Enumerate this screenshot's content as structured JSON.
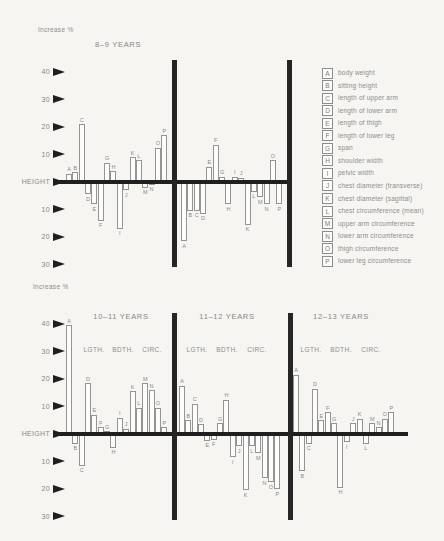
{
  "labels": {
    "increase_top": "Increase %",
    "increase_bottom": "Increase %",
    "height_axis": "HEIGHT"
  },
  "colors": {
    "background": "#f6f5f2",
    "line": "#1f1f1f",
    "divider": "#252525",
    "bar_fill": "#fcfcfa",
    "bar_border": "#949494",
    "text_gray": "#8c8c8c"
  },
  "legend": {
    "position": "right",
    "items": [
      {
        "key": "A",
        "label": "body weight"
      },
      {
        "key": "B",
        "label": "sitting height"
      },
      {
        "key": "C",
        "label": "length of upper arm"
      },
      {
        "key": "D",
        "label": "length of lower arm"
      },
      {
        "key": "E",
        "label": "length of thigh"
      },
      {
        "key": "F",
        "label": "length of lower leg"
      },
      {
        "key": "G",
        "label": "span"
      },
      {
        "key": "H",
        "label": "shoulder width"
      },
      {
        "key": "I",
        "label": "pelvic width"
      },
      {
        "key": "J",
        "label": "chest diameter (transverse)"
      },
      {
        "key": "K",
        "label": "chest diameter (sagittal)"
      },
      {
        "key": "L",
        "label": "chest circumference (mean)"
      },
      {
        "key": "M",
        "label": "upper arm circumference"
      },
      {
        "key": "N",
        "label": "lower arm circumference"
      },
      {
        "key": "O",
        "label": "thigh circumference"
      },
      {
        "key": "P",
        "label": "lower leg circumference"
      }
    ]
  },
  "chart_data": [
    {
      "type": "bar",
      "ylabel": "Increase %",
      "baseline_label": "HEIGHT",
      "ylim": [
        -32,
        45
      ],
      "grid": false,
      "legend_position": "right",
      "yticks": [
        40,
        30,
        20,
        10,
        0,
        -10,
        -20,
        -30
      ],
      "ytick_display": [
        "40",
        "30",
        "20",
        "10",
        "HEIGHT",
        "10",
        "20",
        "30"
      ],
      "categories": [
        "A",
        "B",
        "C",
        "D",
        "E",
        "F",
        "G",
        "H",
        "I",
        "J",
        "K",
        "L",
        "M",
        "N",
        "O",
        "P"
      ],
      "panels": [
        {
          "title": "8–9 YEARS",
          "values": [
            3,
            3.5,
            21,
            -4.5,
            -8,
            -14,
            7,
            4,
            -17,
            -3,
            9,
            8,
            -2,
            -1,
            12.5,
            17
          ]
        },
        {
          "title": "",
          "values": [
            -21.5,
            -10.5,
            -10.5,
            -11.5,
            5.5,
            13.5,
            2,
            -8,
            2,
            1.5,
            -15.5,
            -3.5,
            -5.5,
            -8,
            8,
            -8
          ]
        }
      ]
    },
    {
      "type": "bar",
      "ylabel": "Increase %",
      "baseline_label": "HEIGHT",
      "ylim": [
        -32,
        45
      ],
      "grid": false,
      "group_labels": [
        "LGTH.",
        "BDTH.",
        "CIRC."
      ],
      "yticks": [
        40,
        30,
        20,
        10,
        0,
        -10,
        -20,
        -30
      ],
      "ytick_display": [
        "40",
        "30",
        "20",
        "10",
        "HEIGHT",
        "10",
        "20",
        "30"
      ],
      "categories": [
        "A",
        "B",
        "C",
        "D",
        "E",
        "F",
        "G",
        "H",
        "I",
        "J",
        "K",
        "L",
        "M",
        "N",
        "O",
        "P"
      ],
      "panels": [
        {
          "title": "10–11 YEARS",
          "values": [
            39.5,
            -3.5,
            -11.5,
            18.5,
            7,
            2.5,
            1,
            -5,
            6,
            2,
            15.5,
            9.5,
            18.5,
            16,
            9.5,
            2.5
          ]
        },
        {
          "title": "11–12 YEARS",
          "values": [
            17.5,
            5,
            11,
            3.5,
            -2.5,
            -2,
            4,
            12.5,
            -8.5,
            -4.5,
            -20.5,
            -4.5,
            -7,
            -16,
            -17.5,
            -20
          ]
        },
        {
          "title": "12–13 YEARS",
          "values": [
            21.5,
            -13.5,
            -3.5,
            16.5,
            5,
            8,
            4,
            -19.5,
            -3,
            4,
            5.5,
            -3.5,
            4,
            2.5,
            5.5,
            8
          ]
        }
      ]
    }
  ]
}
